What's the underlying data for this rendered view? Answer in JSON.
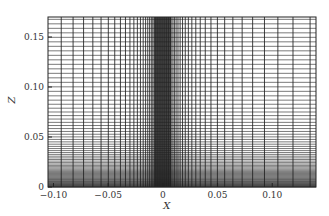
{
  "chart_data": {
    "type": "heatmap",
    "title": "",
    "xlabel": "X",
    "ylabel": "Z",
    "xlim": [
      -0.105,
      0.14
    ],
    "ylim": [
      0,
      0.17
    ],
    "x_ticks": [
      -0.1,
      -0.05,
      0,
      0.05,
      0.1
    ],
    "x_tick_labels": [
      "−0.10",
      "−0.05",
      "0",
      "0.05",
      "0.10"
    ],
    "y_ticks": [
      0,
      0.05,
      0.1,
      0.15
    ],
    "y_tick_labels": [
      "0",
      "0.05",
      "0.10",
      "0.15"
    ],
    "mesh": {
      "x_cluster_center": 0.0,
      "x_cluster_halfwidth": 0.008,
      "z_cluster_at": 0.0,
      "line_color": "#000000"
    },
    "grid": false,
    "legend": "none"
  }
}
